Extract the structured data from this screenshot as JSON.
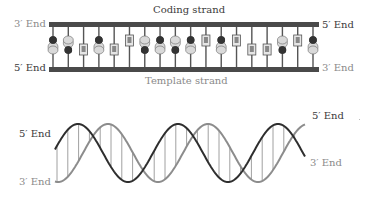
{
  "ladder": {
    "top_label": "Coding strand",
    "bottom_label": "Template strand",
    "top_left_end": "3′ End",
    "top_right_end": "5′ End",
    "bottom_left_end": "5′ End",
    "bottom_right_end": "3′ End",
    "base_pairs": [
      "GC",
      "CG",
      "AT",
      "GC",
      "AT",
      "TA",
      "CG",
      "GC",
      "CG",
      "GC",
      "TA",
      "GC",
      "TA",
      "AT",
      "AT",
      "CG",
      "TA",
      "GC"
    ],
    "colors": {
      "backbone": "#4a4a4a",
      "bond": "#555555",
      "dark_base": "#333333",
      "light_base": "#d9d9d9"
    }
  },
  "helix": {
    "left_top_end": "5′ End",
    "left_bottom_end": "3′ End",
    "right_top_end": "5′ End",
    "right_bottom_end": "3′ End",
    "colors": {
      "dark_strand": "#2e2e2e",
      "light_strand": "#8c8c8c",
      "rungs": "#a0a0a0"
    }
  }
}
